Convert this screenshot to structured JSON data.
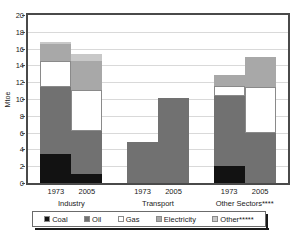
{
  "chart_data": {
    "type": "bar",
    "stacked": true,
    "title": "",
    "xlabel": "",
    "ylabel": "Mtoe",
    "ylim": [
      0,
      20
    ],
    "ytick_step": 2,
    "yticks": [
      "20",
      "18",
      "16",
      "14",
      "12",
      "10",
      "8",
      "6",
      "4",
      "2",
      "0"
    ],
    "grid": true,
    "legend_position": "bottom",
    "categories": [
      "1973",
      "2005",
      "1973",
      "2005",
      "1973",
      "2005"
    ],
    "groups": [
      {
        "label": "Industry",
        "categories": [
          "1973",
          "2005"
        ]
      },
      {
        "label": "Transport",
        "categories": [
          "1973",
          "2005"
        ]
      },
      {
        "label": "Other Sectors****",
        "categories": [
          "1973",
          "2005"
        ]
      }
    ],
    "series": [
      {
        "name": "Coal",
        "color": "#121212",
        "values": [
          3.5,
          1.1,
          0.0,
          0.0,
          2.0,
          0.0
        ]
      },
      {
        "name": "Oil",
        "color": "#717171",
        "values": [
          7.9,
          5.1,
          4.9,
          10.1,
          8.3,
          5.9
        ]
      },
      {
        "name": "Gas",
        "color": "#ffffff",
        "values": [
          3.1,
          4.9,
          0.0,
          0.0,
          1.3,
          5.5
        ]
      },
      {
        "name": "Electricity",
        "color": "#a8a8a8",
        "values": [
          2.0,
          3.4,
          0.0,
          0.0,
          1.2,
          3.6
        ]
      },
      {
        "name": "Other*****",
        "color": "#c8c8c8",
        "values": [
          0.3,
          0.9,
          0.0,
          0.0,
          0.0,
          0.0
        ]
      }
    ],
    "totals": [
      16.8,
      15.4,
      4.9,
      10.1,
      12.8,
      15.0
    ],
    "legend": [
      {
        "label": "Coal",
        "color": "#121212"
      },
      {
        "label": "Oil",
        "color": "#717171"
      },
      {
        "label": "Gas",
        "color": "#ffffff"
      },
      {
        "label": "Electricity",
        "color": "#a8a8a8"
      },
      {
        "label": "Other*****",
        "color": "#c8c8c8"
      }
    ]
  }
}
